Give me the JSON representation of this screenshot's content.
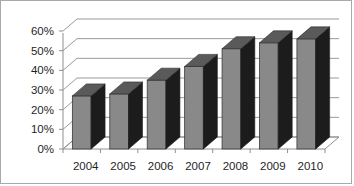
{
  "chart_data": {
    "type": "bar",
    "title": "",
    "subtitle": "",
    "xlabel": "",
    "ylabel": "",
    "categories": [
      "2004",
      "2005",
      "2006",
      "2007",
      "2008",
      "2009",
      "2010"
    ],
    "values": [
      27,
      28,
      35,
      42,
      51,
      54,
      56
    ],
    "ytick_labels": [
      "0%",
      "10%",
      "20%",
      "30%",
      "40%",
      "50%",
      "60%"
    ],
    "ytick_values": [
      0,
      10,
      20,
      30,
      40,
      50,
      60
    ],
    "ylim": [
      0,
      60
    ],
    "grid": true,
    "legend": false,
    "legend_position": "none",
    "three_d": true,
    "series": [
      {
        "name": "Series 1",
        "values": [
          27,
          28,
          35,
          42,
          51,
          54,
          56
        ]
      }
    ],
    "annotations": []
  },
  "style": {
    "bar_front_color": "#898989",
    "bar_side_color": "#1c1c1c",
    "bar_top_color": "#5a5a5a",
    "gridline_color": "#9a9a9a",
    "axis_color": "#8f8f8f",
    "border_color": "#a9a9a9",
    "background_color": "#ffffff",
    "label_color": "#1f1f1f"
  }
}
